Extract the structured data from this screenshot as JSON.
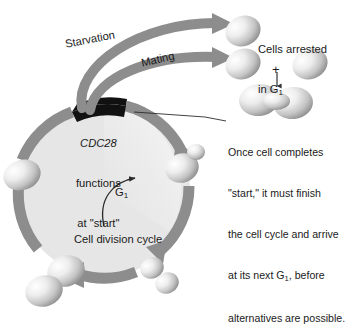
{
  "figure": {
    "type": "yeast-cell-cycle-diagram",
    "labels": {
      "starvation": "Starvation",
      "mating": "Mating",
      "cdc28_line1": "CDC28",
      "cdc28_line2": "functions",
      "cdc28_line3": "at \"start\"",
      "g1": "G",
      "g1_sub": "1",
      "cell_division_cycle": "Cell division cycle",
      "plus": "+"
    },
    "arrested": {
      "line1": "Cells arrested",
      "line2_pre": "in G",
      "line2_sub": "1"
    },
    "caption": {
      "line1": "Once cell completes",
      "line2": "\"start,\" it must finish",
      "line3": "the cell cycle and arrive",
      "line4_pre": "at its next G",
      "line4_sub": "1",
      "line4_post": ", before",
      "line5": "alternatives are possible."
    },
    "colors": {
      "arrow_gray": "#8d8d8d",
      "arrow_gray_dark": "#7b7b7b",
      "ring_interior": "#e6e6e6",
      "ring_wedge": "#f2f2f2",
      "start_block": "#111111",
      "text": "#1a1a1a",
      "cell_light": "#fbfbfb",
      "cell_mid": "#c9c9c9",
      "cell_dark": "#8f8f8f",
      "background": "#ffffff"
    }
  }
}
